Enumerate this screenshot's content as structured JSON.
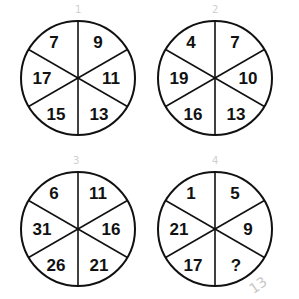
{
  "puzzle": {
    "wheels": [
      {
        "label_mark": "1",
        "segments": {
          "top_left": "7",
          "top_right": "9",
          "right": "11",
          "bottom_right": "13",
          "bottom_left": "15",
          "left": "17"
        }
      },
      {
        "label_mark": "2",
        "segments": {
          "top_left": "4",
          "top_right": "7",
          "right": "10",
          "bottom_right": "13",
          "bottom_left": "16",
          "left": "19"
        }
      },
      {
        "label_mark": "3",
        "segments": {
          "top_left": "6",
          "top_right": "11",
          "right": "16",
          "bottom_right": "21",
          "bottom_left": "26",
          "left": "31"
        }
      },
      {
        "label_mark": "4",
        "segments": {
          "top_left": "1",
          "top_right": "5",
          "right": "9",
          "bottom_right": "?",
          "bottom_left": "17",
          "left": "21"
        }
      }
    ],
    "handwritten_answer": "13"
  },
  "colors": {
    "ink": "#111111",
    "pencil": "#cccccc",
    "background": "#ffffff"
  }
}
